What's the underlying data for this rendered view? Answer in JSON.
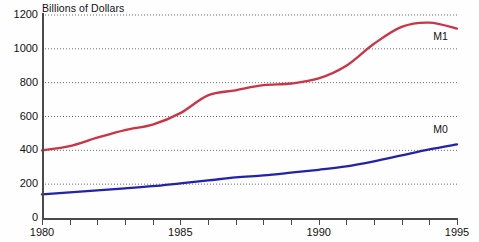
{
  "chart_data": {
    "type": "line",
    "title": "",
    "ylabel": "Billions of Dollars",
    "xlabel": "",
    "ylim": [
      0,
      1200
    ],
    "xlim": [
      1980,
      1995
    ],
    "yticks": [
      0,
      200,
      400,
      600,
      800,
      1000,
      1200
    ],
    "ytick_labels": [
      "0",
      "200",
      "400",
      "600",
      "800",
      "1000",
      "1200"
    ],
    "xticks": [
      1980,
      1981,
      1982,
      1983,
      1984,
      1985,
      1986,
      1987,
      1988,
      1989,
      1990,
      1991,
      1992,
      1993,
      1994,
      1995
    ],
    "xtick_labels": [
      "1980",
      "",
      "",
      "",
      "",
      "1985",
      "",
      "",
      "",
      "",
      "1990",
      "",
      "",
      "",
      "",
      "1995"
    ],
    "grid": "horizontal-dotted",
    "legend_position": "inline-right-of-line-end",
    "x": [
      1980,
      1981,
      1982,
      1983,
      1984,
      1985,
      1986,
      1987,
      1988,
      1989,
      1990,
      1991,
      1992,
      1993,
      1994,
      1995
    ],
    "series": [
      {
        "name": "M1",
        "color": "#cc3344",
        "values": [
          400,
          425,
          475,
          520,
          552,
          620,
          725,
          755,
          785,
          795,
          825,
          900,
          1030,
          1130,
          1155,
          1120
        ]
      },
      {
        "name": "M0",
        "color": "#2222aa",
        "values": [
          140,
          152,
          163,
          175,
          188,
          205,
          222,
          240,
          252,
          268,
          285,
          305,
          335,
          370,
          405,
          435
        ]
      }
    ]
  },
  "axis": {
    "ytitle": "Billions of Dollars"
  },
  "labels": {
    "m1": "M1",
    "m0": "M0"
  }
}
